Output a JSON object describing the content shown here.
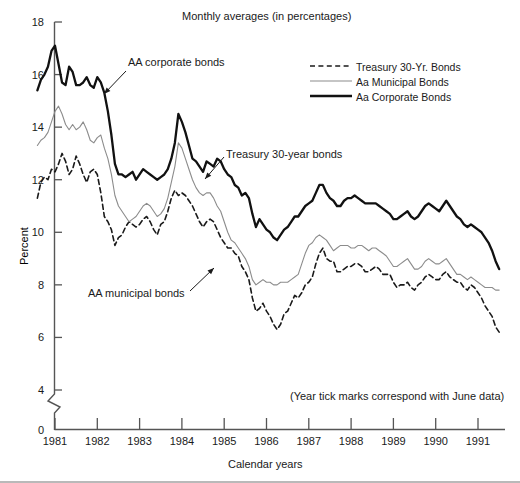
{
  "chart_data": {
    "type": "line",
    "title": "Monthly averages (in percentages)",
    "xlabel": "Calendar years",
    "ylabel": "Percent",
    "note": "(Year tick marks correspond with June data)",
    "xtick_labels": [
      "1981",
      "1982",
      "1983",
      "1984",
      "1985",
      "1986",
      "1987",
      "1988",
      "1989",
      "1990",
      "1991"
    ],
    "ytick_labels": [
      "0",
      "4",
      "6",
      "8",
      "10",
      "12",
      "14",
      "16",
      "18"
    ],
    "ylim": [
      4,
      18
    ],
    "y_axis_break": true,
    "y_break_between": [
      0,
      4
    ],
    "grid": false,
    "legend_position": "top-right",
    "x_start_year": 1981,
    "x_start_month": 1,
    "x_end_year": 1991,
    "x_end_month": 10,
    "tick_month": 6,
    "colors": {
      "treasury": "#1a1a1a",
      "municipal": "#8c8c8c",
      "corporate": "#111111",
      "text": "#1a1a1a",
      "axis": "#555555"
    },
    "series": [
      {
        "name": "Treasury 30-Yr. Bonds",
        "style": "dashed",
        "values": [
          11.3,
          11.9,
          12.1,
          12.0,
          12.4,
          12.3,
          12.6,
          13.0,
          12.7,
          12.2,
          12.4,
          12.9,
          12.6,
          12.2,
          11.9,
          12.3,
          12.4,
          12.2,
          11.5,
          10.6,
          10.4,
          10.1,
          9.5,
          9.8,
          9.9,
          10.2,
          10.4,
          10.3,
          10.2,
          10.3,
          10.5,
          10.6,
          10.4,
          10.1,
          9.9,
          10.3,
          10.4,
          10.8,
          11.3,
          11.6,
          11.4,
          11.5,
          11.4,
          11.2,
          11.0,
          10.7,
          10.4,
          10.2,
          10.4,
          10.5,
          10.4,
          10.1,
          9.8,
          9.6,
          9.4,
          9.4,
          9.2,
          9.1,
          8.7,
          8.5,
          8.2,
          7.5,
          7.0,
          7.1,
          7.3,
          7.0,
          6.8,
          6.5,
          6.3,
          6.5,
          6.9,
          7.0,
          7.3,
          7.6,
          7.5,
          7.7,
          8.0,
          8.1,
          8.3,
          8.8,
          9.2,
          9.4,
          9.0,
          8.9,
          8.9,
          8.5,
          8.5,
          8.6,
          8.7,
          8.7,
          8.8,
          8.8,
          8.7,
          8.5,
          8.5,
          8.6,
          8.7,
          8.6,
          8.4,
          8.4,
          8.4,
          8.1,
          7.9,
          8.0,
          8.0,
          8.1,
          7.9,
          7.8,
          8.0,
          8.1,
          8.3,
          8.4,
          8.3,
          8.2,
          8.2,
          8.4,
          8.5,
          8.3,
          8.2,
          8.1,
          8.1,
          7.9,
          7.8,
          8.0,
          7.9,
          7.7,
          7.5,
          7.2,
          7.0,
          6.8,
          6.4,
          6.2
        ]
      },
      {
        "name": "Aa Municipal Bonds",
        "style": "thin-gray",
        "values": [
          13.3,
          13.5,
          13.6,
          13.8,
          14.2,
          14.6,
          14.8,
          14.5,
          14.1,
          13.9,
          14.1,
          13.9,
          14.0,
          14.2,
          13.9,
          13.5,
          13.4,
          13.6,
          13.7,
          13.2,
          12.8,
          12.2,
          11.4,
          11.0,
          10.8,
          10.6,
          10.4,
          10.5,
          10.6,
          10.8,
          11.0,
          11.1,
          11.0,
          10.8,
          10.6,
          10.7,
          10.9,
          11.3,
          11.9,
          12.5,
          13.4,
          13.2,
          12.8,
          12.4,
          12.0,
          11.7,
          11.5,
          11.4,
          11.5,
          11.5,
          11.3,
          11.0,
          10.8,
          10.4,
          10.0,
          9.7,
          9.6,
          9.4,
          9.2,
          9.0,
          8.7,
          8.2,
          8.0,
          8.1,
          8.2,
          8.1,
          8.1,
          8.0,
          8.0,
          8.1,
          8.1,
          8.1,
          8.2,
          8.3,
          8.4,
          8.8,
          9.2,
          9.5,
          9.6,
          9.8,
          9.9,
          9.8,
          9.7,
          9.5,
          9.3,
          9.4,
          9.5,
          9.5,
          9.5,
          9.4,
          9.4,
          9.5,
          9.5,
          9.4,
          9.3,
          9.4,
          9.4,
          9.3,
          9.2,
          9.1,
          8.9,
          8.7,
          8.7,
          8.8,
          8.9,
          9.0,
          8.8,
          8.6,
          8.6,
          8.7,
          8.9,
          9.0,
          8.9,
          8.8,
          8.8,
          8.9,
          9.0,
          8.8,
          8.6,
          8.4,
          8.4,
          8.3,
          8.2,
          8.3,
          8.2,
          8.1,
          8.0,
          7.9,
          7.9,
          7.9,
          7.8,
          7.8
        ]
      },
      {
        "name": "Aa Corporate Bonds",
        "style": "thick-black",
        "values": [
          15.4,
          15.8,
          16.0,
          16.3,
          16.9,
          17.1,
          16.4,
          15.7,
          15.6,
          16.3,
          16.1,
          15.6,
          15.6,
          15.7,
          15.9,
          15.6,
          15.5,
          15.9,
          15.7,
          15.3,
          14.6,
          13.7,
          12.6,
          12.2,
          12.2,
          12.1,
          12.2,
          12.3,
          12.0,
          12.2,
          12.4,
          12.3,
          12.2,
          12.1,
          12.0,
          12.1,
          12.2,
          12.4,
          12.8,
          13.4,
          14.5,
          14.2,
          13.8,
          13.3,
          12.8,
          12.7,
          12.5,
          12.3,
          12.7,
          12.6,
          12.5,
          12.8,
          12.7,
          12.4,
          12.2,
          12.1,
          11.8,
          11.7,
          11.4,
          11.5,
          11.3,
          10.7,
          10.2,
          10.5,
          10.3,
          10.1,
          10.0,
          9.8,
          9.7,
          9.9,
          10.1,
          10.2,
          10.4,
          10.6,
          10.6,
          10.8,
          11.0,
          11.1,
          11.2,
          11.5,
          11.8,
          11.8,
          11.5,
          11.3,
          11.2,
          11.0,
          11.0,
          11.2,
          11.3,
          11.3,
          11.4,
          11.3,
          11.2,
          11.1,
          11.1,
          11.1,
          11.1,
          11.0,
          10.9,
          10.8,
          10.7,
          10.5,
          10.5,
          10.6,
          10.7,
          10.8,
          10.6,
          10.5,
          10.6,
          10.8,
          11.0,
          11.1,
          11.0,
          10.9,
          10.8,
          11.0,
          11.2,
          11.0,
          10.8,
          10.6,
          10.5,
          10.3,
          10.2,
          10.3,
          10.2,
          10.1,
          10.0,
          9.8,
          9.6,
          9.3,
          8.9,
          8.6
        ]
      }
    ]
  },
  "legend": {
    "items": [
      {
        "label": "Treasury 30-Yr. Bonds",
        "style": "dashed"
      },
      {
        "label": "Aa Municipal Bonds",
        "style": "thin-gray"
      },
      {
        "label": "Aa Corporate Bonds",
        "style": "thick-black"
      }
    ]
  },
  "annotations": [
    {
      "id": "corporate",
      "text": "AA corporate bonds"
    },
    {
      "id": "treasury",
      "text": "Treasury 30-year bonds"
    },
    {
      "id": "municipal",
      "text": "AA municipal bonds"
    }
  ]
}
